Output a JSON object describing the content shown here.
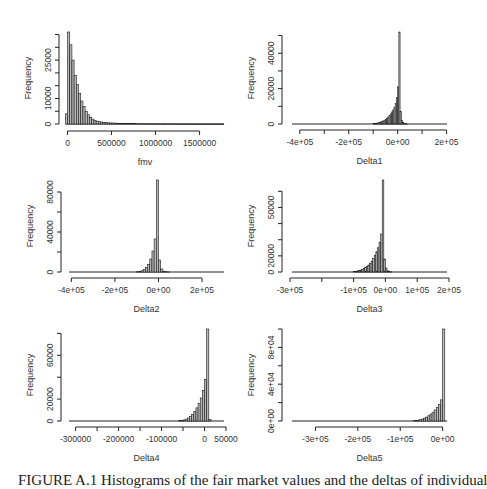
{
  "chart_data": [
    {
      "type": "bar",
      "panel": 1,
      "title": "",
      "xlabel": "fmv",
      "ylabel": "Frequency",
      "xlim": [
        -40000,
        1800000
      ],
      "ylim": [
        0,
        36000
      ],
      "xticks": [
        0,
        500000,
        1000000,
        1500000
      ],
      "xtick_labels": [
        "0",
        "500000",
        "1000000",
        "1500000"
      ],
      "yticks": [
        0,
        5000,
        10000,
        15000,
        20000,
        25000,
        30000,
        35000
      ],
      "ytick_labels": [
        "0",
        "",
        "10000",
        "",
        "",
        "25000",
        "",
        ""
      ],
      "bin_width": 25000,
      "bin_start": -25000,
      "values": [
        4000,
        36000,
        31000,
        25000,
        19000,
        15500,
        12000,
        9000,
        6800,
        5000,
        3600,
        2600,
        1900,
        1400,
        1100,
        900,
        750,
        650,
        560,
        480,
        420,
        380,
        340,
        300,
        270,
        240,
        210,
        190,
        170,
        150,
        130,
        120,
        110,
        100,
        90,
        80,
        70,
        60,
        55,
        50,
        45,
        40,
        35,
        30,
        28,
        26,
        24,
        22,
        20,
        18,
        16,
        14,
        12,
        10,
        9,
        8,
        7,
        6,
        5,
        4,
        4,
        3,
        3,
        2,
        2,
        2,
        1,
        1,
        1,
        1,
        1,
        1
      ]
    },
    {
      "type": "bar",
      "panel": 2,
      "title": "",
      "xlabel": "Delta1",
      "ylabel": "Frequency",
      "xlim": [
        -440000,
        210000
      ],
      "ylim": [
        0,
        52000
      ],
      "xticks": [
        -400000,
        -300000,
        -200000,
        -100000,
        0,
        100000,
        200000
      ],
      "xtick_labels": [
        "-4e+05",
        "",
        "-2e+05",
        "",
        "0e+00",
        "",
        "2e+05"
      ],
      "yticks": [
        0,
        10000,
        20000,
        30000,
        40000,
        50000
      ],
      "ytick_labels": [
        "0",
        "",
        "20000",
        "",
        "40000",
        ""
      ],
      "bin_width": 5000,
      "bin_start": -100000,
      "values": [
        200,
        300,
        400,
        550,
        700,
        900,
        1150,
        1450,
        1800,
        2200,
        2700,
        3300,
        4000,
        4800,
        5700,
        6800,
        8000,
        9500,
        11500,
        15000,
        21000,
        52000,
        7000,
        2000,
        800,
        300,
        150,
        80
      ]
    },
    {
      "type": "bar",
      "panel": 3,
      "title": "",
      "xlabel": "Delta2",
      "ylabel": "Frequency",
      "xlim": [
        -420000,
        310000
      ],
      "ylim": [
        0,
        92000
      ],
      "xticks": [
        -400000,
        -200000,
        0,
        200000
      ],
      "xtick_labels": [
        "-4e+05",
        "-2e+05",
        "0e+00",
        "2e+05"
      ],
      "yticks": [
        0,
        20000,
        40000,
        60000,
        80000
      ],
      "ytick_labels": [
        "0",
        "",
        "40000",
        "",
        "80000"
      ],
      "bin_width": 10000,
      "bin_start": -100000,
      "values": [
        300,
        600,
        1200,
        2500,
        4500,
        7500,
        13000,
        21000,
        33000,
        92000,
        12000,
        3000,
        800,
        300,
        100
      ]
    },
    {
      "type": "bar",
      "panel": 4,
      "title": "",
      "xlabel": "Delta3",
      "ylabel": "Frequency",
      "xlim": [
        -300000,
        200000
      ],
      "ylim": [
        0,
        57000
      ],
      "xticks": [
        -300000,
        -200000,
        -100000,
        0,
        100000,
        200000
      ],
      "xtick_labels": [
        "-3e+05",
        "",
        "-1e+05",
        "0e+00",
        "1e+05",
        "2e+05"
      ],
      "yticks": [
        0,
        10000,
        20000,
        30000,
        40000,
        50000
      ],
      "ytick_labels": [
        "0",
        "20000",
        "",
        "",
        "50000",
        ""
      ],
      "bin_width": 5000,
      "bin_start": -100000,
      "values": [
        300,
        450,
        650,
        900,
        1200,
        1600,
        2100,
        2700,
        3400,
        4300,
        5400,
        6700,
        8300,
        10200,
        12500,
        15000,
        18500,
        23500,
        57000,
        8000,
        2500,
        800,
        250,
        100
      ]
    },
    {
      "type": "bar",
      "panel": 5,
      "title": "",
      "xlabel": "Delta4",
      "ylabel": "Frequency",
      "xlim": [
        -320000,
        50000
      ],
      "ylim": [
        0,
        84000
      ],
      "xticks": [
        -300000,
        -250000,
        -200000,
        -150000,
        -100000,
        -50000,
        0,
        50000
      ],
      "xtick_labels": [
        "-300000",
        "",
        "-200000",
        "",
        "-100000",
        "",
        "0",
        "50000"
      ],
      "yticks": [
        0,
        20000,
        40000,
        60000,
        80000
      ],
      "ytick_labels": [
        "0",
        "20000",
        "",
        "60000",
        ""
      ],
      "bin_width": 5000,
      "bin_start": -60000,
      "values": [
        300,
        600,
        1000,
        1700,
        2700,
        4000,
        6000,
        8500,
        12000,
        16000,
        21000,
        28000,
        38000,
        84000,
        1500
      ]
    },
    {
      "type": "bar",
      "panel": 6,
      "title": "",
      "xlabel": "Delta5",
      "ylabel": "Frequency",
      "xlim": [
        -360000,
        15000
      ],
      "ylim": [
        0,
        100000
      ],
      "xticks": [
        -300000,
        -200000,
        -100000,
        0
      ],
      "xtick_labels": [
        "-3e+05",
        "-2e+05",
        "-1e+05",
        "0e+00"
      ],
      "yticks": [
        0,
        20000,
        40000,
        60000,
        80000,
        100000
      ],
      "ytick_labels": [
        "0e+00",
        "",
        "4e+04",
        "",
        "8e+04",
        ""
      ],
      "bin_width": 5000,
      "bin_start": -70000,
      "values": [
        300,
        550,
        900,
        1400,
        2100,
        3000,
        4200,
        5700,
        7500,
        9600,
        12000,
        14800,
        18000,
        23000,
        100000
      ]
    }
  ],
  "caption": "FIGURE A.1  Histograms of the fair market values and the deltas of individual"
}
